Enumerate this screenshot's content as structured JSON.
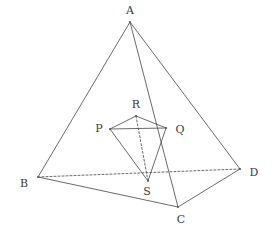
{
  "figure": {
    "width": 273,
    "height": 239,
    "background_color": "#ffffff",
    "stroke_color": "#595959",
    "label_color": "#3a3a3a",
    "stroke_width": 0.9
  },
  "vertices": {
    "A": {
      "label": "A",
      "x": 130,
      "y": 22,
      "label_x": 130,
      "label_y": 10
    },
    "B": {
      "label": "B",
      "x": 38,
      "y": 177,
      "label_x": 24,
      "label_y": 183
    },
    "C": {
      "label": "C",
      "x": 178,
      "y": 207,
      "label_x": 181,
      "label_y": 219
    },
    "D": {
      "label": "D",
      "x": 240,
      "y": 169,
      "label_x": 254,
      "label_y": 172
    },
    "P": {
      "label": "P",
      "x": 110,
      "y": 129,
      "label_x": 99,
      "label_y": 128
    },
    "Q": {
      "label": "Q",
      "x": 166,
      "y": 128,
      "label_x": 180,
      "label_y": 129
    },
    "R": {
      "label": "R",
      "x": 136,
      "y": 116,
      "label_x": 136,
      "label_y": 104
    },
    "S": {
      "label": "S",
      "x": 148,
      "y": 181,
      "label_x": 147,
      "label_y": 191
    }
  },
  "edges": {
    "outer": [
      {
        "name": "edge-AB",
        "from": "A",
        "to": "B",
        "style": "solid"
      },
      {
        "name": "edge-AC",
        "from": "A",
        "to": "C",
        "style": "solid"
      },
      {
        "name": "edge-AD",
        "from": "A",
        "to": "D",
        "style": "solid"
      },
      {
        "name": "edge-BC",
        "from": "B",
        "to": "C",
        "style": "solid"
      },
      {
        "name": "edge-CD",
        "from": "C",
        "to": "D",
        "style": "solid"
      },
      {
        "name": "edge-BD",
        "from": "B",
        "to": "D",
        "style": "dashed"
      }
    ],
    "inner": [
      {
        "name": "edge-PQ",
        "from": "P",
        "to": "Q",
        "style": "solid"
      },
      {
        "name": "edge-PR",
        "from": "P",
        "to": "R",
        "style": "solid"
      },
      {
        "name": "edge-QR",
        "from": "Q",
        "to": "R",
        "style": "solid"
      },
      {
        "name": "edge-PS",
        "from": "P",
        "to": "S",
        "style": "solid"
      },
      {
        "name": "edge-QS",
        "from": "Q",
        "to": "S",
        "style": "solid"
      },
      {
        "name": "edge-RS",
        "from": "R",
        "to": "S",
        "style": "dashed"
      }
    ]
  },
  "dash_pattern": "2,2"
}
